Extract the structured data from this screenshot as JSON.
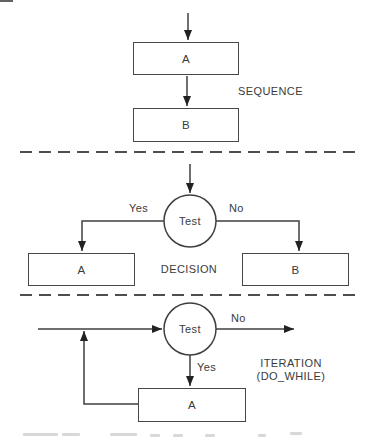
{
  "canvas": {
    "width": 376,
    "height": 440,
    "background": "#ffffff",
    "line_color": "#3f3f3f",
    "dashed_line_color": "#4e4e4e",
    "text_color": "#3a3a3a"
  },
  "sequence": {
    "caption": "SEQUENCE",
    "box_a_label": "A",
    "box_b_label": "B"
  },
  "decision": {
    "caption": "DECISION",
    "test_label": "Test",
    "yes_label": "Yes",
    "no_label": "No",
    "box_a_label": "A",
    "box_b_label": "B"
  },
  "iteration": {
    "caption_line1": "ITERATION",
    "caption_line2": "(DO_WHILE)",
    "test_label": "Test",
    "yes_label": "Yes",
    "no_label": "No",
    "box_a_label": "A"
  }
}
